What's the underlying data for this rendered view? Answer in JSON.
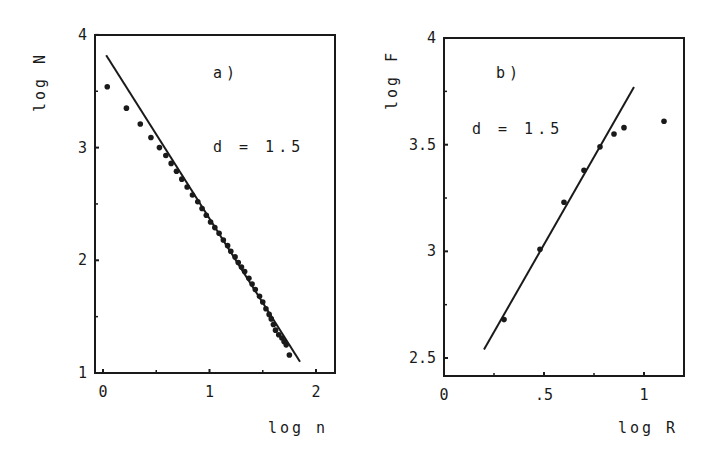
{
  "colors": {
    "ink": "#1a1a1a",
    "background": "#ffffff"
  },
  "chart_data": [
    {
      "type": "scatter",
      "panel": "a)",
      "annotation": "d = 1.5",
      "xlabel": "log n",
      "ylabel": "log N",
      "xlim": [
        -0.05,
        2.2
      ],
      "ylim": [
        1,
        4
      ],
      "xticks": [
        "0",
        "1",
        "2"
      ],
      "yticks": [
        "1",
        "2",
        "3",
        "4"
      ],
      "grid": false,
      "points": {
        "x": [
          0.04,
          0.22,
          0.35,
          0.45,
          0.53,
          0.59,
          0.64,
          0.69,
          0.74,
          0.79,
          0.84,
          0.89,
          0.93,
          0.97,
          1.01,
          1.05,
          1.09,
          1.13,
          1.17,
          1.2,
          1.24,
          1.27,
          1.3,
          1.33,
          1.37,
          1.4,
          1.43,
          1.47,
          1.5,
          1.53,
          1.56,
          1.58,
          1.6,
          1.62,
          1.65,
          1.68,
          1.7,
          1.72,
          1.75
        ],
        "y": [
          3.54,
          3.35,
          3.21,
          3.09,
          3.0,
          2.93,
          2.86,
          2.79,
          2.72,
          2.65,
          2.58,
          2.52,
          2.46,
          2.4,
          2.34,
          2.29,
          2.24,
          2.18,
          2.13,
          2.08,
          2.03,
          1.98,
          1.94,
          1.9,
          1.84,
          1.79,
          1.74,
          1.68,
          1.63,
          1.57,
          1.52,
          1.48,
          1.43,
          1.38,
          1.34,
          1.31,
          1.28,
          1.25,
          1.16
        ]
      },
      "fit_line": {
        "x": [
          0.03,
          1.85
        ],
        "y": [
          3.82,
          1.1
        ]
      }
    },
    {
      "type": "scatter",
      "panel": "b)",
      "annotation": "d = 1.5",
      "xlabel": "log R",
      "ylabel": "log F",
      "xlim": [
        0,
        1.2
      ],
      "ylim": [
        2.4,
        4
      ],
      "xticks": [
        "0",
        ".5",
        "1"
      ],
      "yticks": [
        "2.5",
        "3",
        "3.5",
        "4"
      ],
      "grid": false,
      "points": {
        "x": [
          0.3,
          0.48,
          0.6,
          0.7,
          0.78,
          0.85,
          0.9,
          1.1
        ],
        "y": [
          2.68,
          3.01,
          3.23,
          3.38,
          3.49,
          3.55,
          3.58,
          3.61
        ]
      },
      "fit_line": {
        "x": [
          0.2,
          0.95
        ],
        "y": [
          2.54,
          3.77
        ]
      }
    }
  ]
}
